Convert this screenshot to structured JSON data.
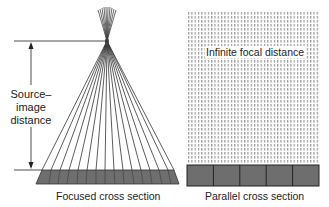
{
  "left_panel": {
    "caption": "Focused cross section",
    "dimension_label": [
      "Source–",
      "image",
      "distance"
    ],
    "focal_point": [
      107,
      41
    ],
    "ray_count": 15,
    "base_cells": 8
  },
  "right_panel": {
    "caption": "Parallel cross section",
    "overlay_label": "Infinite focal distance",
    "base_cells": 5
  },
  "colors": {
    "line": "#222222",
    "detector_fill": "#6e6e6e",
    "dot_pattern": "#9a9a9a"
  }
}
